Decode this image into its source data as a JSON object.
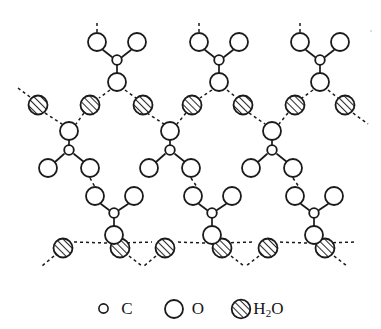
{
  "figure": {
    "background_color": "#ffffff",
    "stroke_color": "#1a1a1a",
    "hatch_color": "#2b2b2b"
  },
  "legend": {
    "items": [
      {
        "key": "carbon",
        "symbol": "C",
        "sub": "",
        "marker": "small-open-circle",
        "radius_px": 4.5
      },
      {
        "key": "oxygen",
        "symbol": "O",
        "sub": "",
        "marker": "large-open-circle",
        "radius_px": 9
      },
      {
        "key": "water",
        "symbol": "H",
        "sub": "2",
        "symbol_tail": "O",
        "marker": "hatched-circle",
        "radius_px": 9.5
      }
    ]
  },
  "structure": {
    "description": "Three vertical columns of oxalate units bridged by two horizontal rows of water molecules, with dashed hydrogen bonds.",
    "columns": [
      3
    ],
    "water_row_upper_count": 7,
    "water_row_lower_count": 6,
    "bond_style_covalent": "solid",
    "bond_style_hydrogen": "dashed",
    "radii": {
      "carbon": 4.5,
      "oxygen": 9,
      "water": 9.5
    },
    "columns_x": [
      117,
      219,
      320
    ],
    "water_upper_y": 105,
    "water_lower_y": 248,
    "water_upper_x": [
      38,
      90,
      143,
      192,
      243,
      295,
      345
    ],
    "water_lower_x": [
      63,
      120,
      165,
      222,
      268,
      325
    ]
  }
}
